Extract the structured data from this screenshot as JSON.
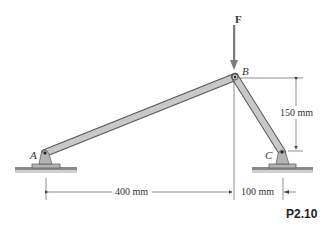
{
  "figure": {
    "id": "P2.10",
    "force": {
      "label": "F",
      "direction": "down"
    },
    "points": {
      "A": "A",
      "B": "B",
      "C": "C"
    },
    "dimensions": {
      "horizontal_AB": "400 mm",
      "horizontal_BC": "100 mm",
      "vertical_BC": "150 mm"
    },
    "members": [
      "AB",
      "BC"
    ],
    "supports": [
      "pin-A",
      "pin-C"
    ],
    "colors": {
      "member_fill": "#c8c8c8",
      "member_stroke": "#555555",
      "support_fill": "#b4b4b4",
      "ground": "#8a8a8a",
      "arrow": "#7a7a7a",
      "dim_line": "#444444"
    }
  }
}
